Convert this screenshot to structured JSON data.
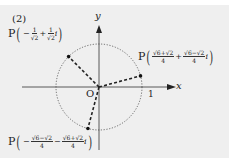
{
  "problem_label": "(2)",
  "axes": {
    "x_label": "x",
    "y_label": "y",
    "origin_label": "O",
    "unit_tick_label": "1"
  },
  "circle": {
    "radius": 1,
    "style": "dotted"
  },
  "points": [
    {
      "label": "P",
      "sign1": "−",
      "re_num": "1",
      "re_den": "√2",
      "op": "+",
      "im_num": "1",
      "im_den": "√2",
      "i": "i",
      "angle_deg": 135
    },
    {
      "label": "P",
      "sign1": "",
      "re_num": "√6+√2",
      "re_den": "4",
      "op": "+",
      "im_num": "√6−√2",
      "im_den": "4",
      "i": "i",
      "angle_deg": 15
    },
    {
      "label": "P",
      "sign1": "−",
      "re_num": "√6−√2",
      "re_den": "4",
      "op": "−",
      "im_num": "√6+√2",
      "im_den": "4",
      "i": "i",
      "angle_deg": -105
    }
  ],
  "colors": {
    "background": "#efefef",
    "ink": "#222222"
  }
}
